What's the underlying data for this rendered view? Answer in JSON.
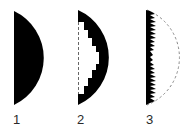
{
  "figure": {
    "title": "",
    "colors": {
      "fill": "#000000",
      "dashed_outline": "#8a8a8a",
      "label": "#2a2a2a",
      "background": "#ffffff"
    },
    "panels": [
      {
        "id": 1,
        "label": "1",
        "description": "plano-convex lens cross-section (solid)"
      },
      {
        "id": 2,
        "label": "2",
        "description": "lens with stepped inner material removed, dashed flat edge"
      },
      {
        "id": 3,
        "label": "3",
        "description": "thin sawtooth Fresnel lens with dashed original curve outline"
      }
    ]
  }
}
